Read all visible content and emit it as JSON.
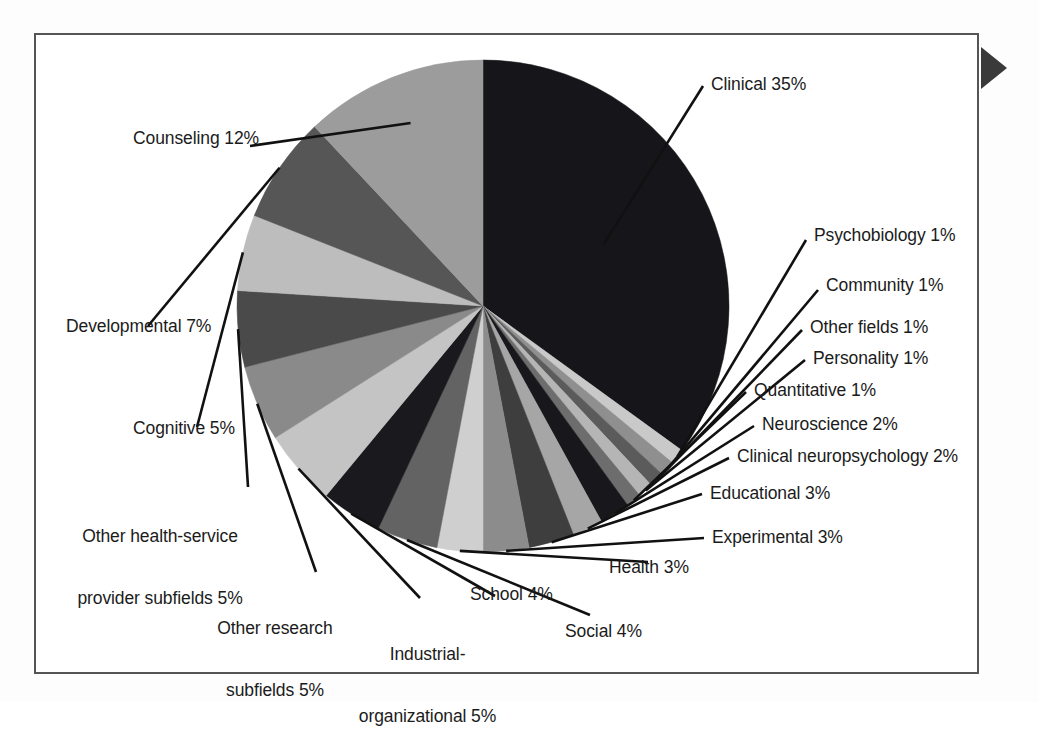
{
  "figure": {
    "frame_color": "#555555",
    "background": "#ffffff",
    "edge_marker_name": "right-pointing-arrow-marker"
  },
  "chart_data": {
    "type": "pie",
    "title": "",
    "subtitle": "",
    "xlabel": "",
    "ylabel": "",
    "legend": "none",
    "grid": false,
    "units": "percent",
    "total": 100,
    "start_angle_deg": -90,
    "direction": "clockwise",
    "categories": [
      "Clinical",
      "Psychobiology",
      "Community",
      "Other fields",
      "Personality",
      "Quantitative",
      "Neuroscience",
      "Clinical neuropsychology",
      "Educational",
      "Experimental",
      "Health",
      "Social",
      "School",
      "Industrial-organizational",
      "Other research subfields",
      "Other health-service provider subfields",
      "Cognitive",
      "Developmental",
      "Counseling"
    ],
    "values": [
      35,
      1,
      1,
      1,
      1,
      1,
      2,
      2,
      3,
      3,
      3,
      4,
      4,
      5,
      5,
      5,
      5,
      7,
      12
    ],
    "colors": [
      "#16161a",
      "#c9c9c9",
      "#8f8f8f",
      "#5b5b5b",
      "#b5b5b5",
      "#6d6d6d",
      "#18181c",
      "#a6a6a6",
      "#3e3e3e",
      "#8c8c8c",
      "#cfcfcf",
      "#636363",
      "#1a1a1e",
      "#c4c4c4",
      "#8a8a8a",
      "#4a4a4a",
      "#bdbdbd",
      "#565656",
      "#9c9c9c"
    ],
    "slices": [
      {
        "label": "Clinical 35%",
        "name": "Clinical",
        "value": 35,
        "color": "#16161a"
      },
      {
        "label": "Psychobiology 1%",
        "name": "Psychobiology",
        "value": 1,
        "color": "#c9c9c9"
      },
      {
        "label": "Community 1%",
        "name": "Community",
        "value": 1,
        "color": "#8f8f8f"
      },
      {
        "label": "Other fields 1%",
        "name": "Other fields",
        "value": 1,
        "color": "#5b5b5b"
      },
      {
        "label": "Personality 1%",
        "name": "Personality",
        "value": 1,
        "color": "#b5b5b5"
      },
      {
        "label": "Quantitative 1%",
        "name": "Quantitative",
        "value": 1,
        "color": "#6d6d6d"
      },
      {
        "label": "Neuroscience 2%",
        "name": "Neuroscience",
        "value": 2,
        "color": "#18181c"
      },
      {
        "label": "Clinical neuropsychology 2%",
        "name": "Clinical neuropsychology",
        "value": 2,
        "color": "#a6a6a6"
      },
      {
        "label": "Educational 3%",
        "name": "Educational",
        "value": 3,
        "color": "#3e3e3e"
      },
      {
        "label": "Experimental 3%",
        "name": "Experimental",
        "value": 3,
        "color": "#8c8c8c"
      },
      {
        "label": "Health 3%",
        "name": "Health",
        "value": 3,
        "color": "#cfcfcf"
      },
      {
        "label": "Social 4%",
        "name": "Social",
        "value": 4,
        "color": "#636363"
      },
      {
        "label": "School 4%",
        "name": "School",
        "value": 4,
        "color": "#1a1a1e"
      },
      {
        "label": "Industrial-\norganizational 5%",
        "name": "Industrial-organizational",
        "value": 5,
        "color": "#c4c4c4"
      },
      {
        "label": "Other research\nsubfields 5%",
        "name": "Other research subfields",
        "value": 5,
        "color": "#8a8a8a"
      },
      {
        "label": "Other health-service\nprovider subfields 5%",
        "name": "Other health-service provider subfields",
        "value": 5,
        "color": "#4a4a4a"
      },
      {
        "label": "Cognitive 5%",
        "name": "Cognitive",
        "value": 5,
        "color": "#bdbdbd"
      },
      {
        "label": "Developmental 7%",
        "name": "Developmental",
        "value": 7,
        "color": "#565656"
      },
      {
        "label": "Counseling 12%",
        "name": "Counseling",
        "value": 12,
        "color": "#9c9c9c"
      }
    ]
  },
  "labels": {
    "clinical": "Clinical 35%",
    "psychobiology": "Psychobiology 1%",
    "community": "Community 1%",
    "other_fields": "Other fields 1%",
    "personality": "Personality 1%",
    "quantitative": "Quantitative 1%",
    "neuroscience": "Neuroscience 2%",
    "clinical_neuropsychology": "Clinical neuropsychology 2%",
    "educational": "Educational 3%",
    "experimental": "Experimental 3%",
    "health": "Health 3%",
    "social": "Social 4%",
    "school": "School 4%",
    "industrial_organizational_l1": "Industrial-",
    "industrial_organizational_l2": "organizational 5%",
    "other_research_l1": "Other research",
    "other_research_l2": "subfields 5%",
    "other_hsp_l1": "Other health-service",
    "other_hsp_l2": "provider subfields 5%",
    "cognitive": "Cognitive 5%",
    "developmental": "Developmental 7%",
    "counseling": "Counseling 12%"
  }
}
